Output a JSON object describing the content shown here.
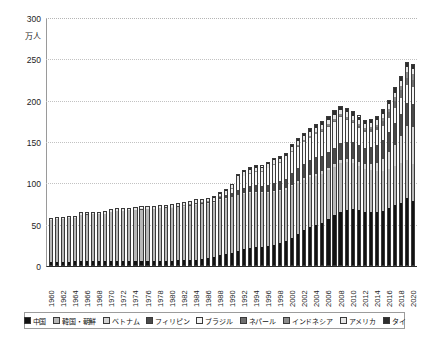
{
  "chart_data": {
    "type": "bar",
    "stacked": true,
    "title": "",
    "xlabel": "",
    "ylabel": "万人",
    "ylim": [
      0,
      300
    ],
    "yticks": [
      0,
      50,
      100,
      150,
      200,
      250,
      300
    ],
    "grid": true,
    "legend_position": "bottom",
    "categories": [
      "1960",
      "1961",
      "1962",
      "1963",
      "1964",
      "1965",
      "1966",
      "1967",
      "1968",
      "1969",
      "1970",
      "1971",
      "1972",
      "1973",
      "1974",
      "1975",
      "1976",
      "1977",
      "1978",
      "1979",
      "1980",
      "1981",
      "1982",
      "1983",
      "1984",
      "1985",
      "1986",
      "1987",
      "1988",
      "1989",
      "1990",
      "1991",
      "1992",
      "1993",
      "1994",
      "1995",
      "1996",
      "1997",
      "1998",
      "1999",
      "2000",
      "2001",
      "2002",
      "2003",
      "2004",
      "2005",
      "2006",
      "2007",
      "2008",
      "2009",
      "2010",
      "2011",
      "2012",
      "2013",
      "2014",
      "2015",
      "2016",
      "2017",
      "2018",
      "2019",
      "2020"
    ],
    "tick_labels": [
      "1960",
      "1962",
      "1964",
      "1966",
      "1968",
      "1970",
      "1972",
      "1974",
      "1976",
      "1978",
      "1980",
      "1982",
      "1984",
      "1986",
      "1988",
      "1990",
      "1992",
      "1994",
      "1996",
      "1998",
      "2000",
      "2002",
      "2004",
      "2006",
      "2008",
      "2010",
      "2012",
      "2014",
      "2016",
      "2018",
      "2020"
    ],
    "series": [
      {
        "name": "中国",
        "color": "#121212",
        "values": [
          4.2,
          4.3,
          4.3,
          4.4,
          4.5,
          4.9,
          4.9,
          5.0,
          5.0,
          5.1,
          5.1,
          5.2,
          4.9,
          4.7,
          4.7,
          4.8,
          4.8,
          4.8,
          4.9,
          5.1,
          5.3,
          5.8,
          6.0,
          6.3,
          6.7,
          7.5,
          8.5,
          9.6,
          12.9,
          13.7,
          15.0,
          17.1,
          19.5,
          21.0,
          21.9,
          22.3,
          23.4,
          25.2,
          27.2,
          29.4,
          33.6,
          38.1,
          42.4,
          46.3,
          48.7,
          52.0,
          56.0,
          60.7,
          65.5,
          68.0,
          68.7,
          67.4,
          65.3,
          64.9,
          65.5,
          66.6,
          69.6,
          73.1,
          76.4,
          81.3,
          77.8
        ]
      },
      {
        "name": "韓国・朝鮮",
        "color": "#b8b8b8",
        "values": [
          53.1,
          53.5,
          54.0,
          54.5,
          55.0,
          58.3,
          58.5,
          58.8,
          59.0,
          59.3,
          61.4,
          62.2,
          62.9,
          63.6,
          64.3,
          64.7,
          65.0,
          65.4,
          65.9,
          66.3,
          66.5,
          66.8,
          66.9,
          67.4,
          68.7,
          68.3,
          67.8,
          67.4,
          67.7,
          68.1,
          68.8,
          69.3,
          68.8,
          68.2,
          67.6,
          66.6,
          65.7,
          64.5,
          63.9,
          63.6,
          63.5,
          63.2,
          62.5,
          61.4,
          60.7,
          59.9,
          59.9,
          59.3,
          58.9,
          57.9,
          56.6,
          54.5,
          53.0,
          51.9,
          50.1,
          49.2,
          48.5,
          48.1,
          47.9,
          47.4,
          45.5
        ]
      },
      {
        "name": "ベトナム",
        "color": "#d4d4d4",
        "values": [
          0,
          0,
          0,
          0,
          0,
          0,
          0,
          0,
          0,
          0,
          0,
          0,
          0,
          0,
          0,
          0,
          0,
          0,
          0,
          0,
          0.2,
          0.3,
          0.4,
          0.5,
          0.6,
          0.7,
          0.8,
          0.9,
          1.0,
          1.1,
          0.6,
          0.7,
          0.8,
          0.9,
          1.0,
          1.1,
          1.3,
          1.5,
          1.7,
          1.9,
          1.7,
          1.9,
          2.2,
          2.4,
          2.7,
          2.9,
          3.3,
          3.7,
          4.1,
          4.1,
          4.2,
          4.5,
          5.3,
          7.2,
          10.0,
          14.7,
          19.9,
          26.2,
          33.1,
          41.2,
          44.9
        ]
      },
      {
        "name": "フィリピン",
        "color": "#4a4a4a",
        "values": [
          0.1,
          0.1,
          0.1,
          0.1,
          0.1,
          0.1,
          0.1,
          0.1,
          0.1,
          0.1,
          0.2,
          0.2,
          0.2,
          0.2,
          0.3,
          0.3,
          0.4,
          0.4,
          0.5,
          0.6,
          0.5,
          0.7,
          0.9,
          1.2,
          1.6,
          1.2,
          1.8,
          2.4,
          3.2,
          3.9,
          4.9,
          6.1,
          6.2,
          7.3,
          8.5,
          7.4,
          8.5,
          9.4,
          10.5,
          11.5,
          14.4,
          15.6,
          16.9,
          18.5,
          19.9,
          18.7,
          19.3,
          20.3,
          21.1,
          21.2,
          21.0,
          20.9,
          20.3,
          21.0,
          21.8,
          22.9,
          24.4,
          26.1,
          27.2,
          28.3,
          28.0
        ]
      },
      {
        "name": "ブラジル",
        "color": "#f4f4f4",
        "values": [
          0,
          0,
          0,
          0,
          0,
          0,
          0,
          0,
          0,
          0,
          0,
          0,
          0,
          0,
          0,
          0,
          0,
          0,
          0,
          0,
          0.1,
          0.1,
          0.1,
          0.1,
          0.2,
          0.2,
          0.2,
          0.2,
          0.4,
          1.5,
          5.6,
          11.9,
          14.7,
          15.5,
          16.0,
          17.6,
          20.2,
          23.3,
          22.2,
          22.4,
          25.4,
          26.6,
          26.8,
          27.5,
          28.7,
          30.2,
          31.3,
          31.7,
          31.2,
          26.7,
          23.0,
          21.0,
          19.0,
          18.1,
          17.6,
          17.4,
          18.0,
          19.1,
          20.2,
          21.2,
          20.9
        ]
      },
      {
        "name": "ネパール",
        "color": "#6e6e6e",
        "values": [
          0,
          0,
          0,
          0,
          0,
          0,
          0,
          0,
          0,
          0,
          0,
          0,
          0,
          0,
          0,
          0,
          0,
          0,
          0,
          0,
          0,
          0,
          0,
          0,
          0,
          0,
          0,
          0,
          0,
          0,
          0,
          0,
          0,
          0,
          0,
          0,
          0,
          0,
          0,
          0,
          0.3,
          0.3,
          0.4,
          0.4,
          0.5,
          0.6,
          0.7,
          0.9,
          1.2,
          1.5,
          1.8,
          2.1,
          2.5,
          3.2,
          4.2,
          5.5,
          6.7,
          8.0,
          8.9,
          9.7,
          9.6
        ]
      },
      {
        "name": "インドネシア",
        "color": "#8c8c8c",
        "values": [
          0,
          0,
          0,
          0,
          0,
          0,
          0,
          0,
          0,
          0,
          0,
          0,
          0,
          0,
          0,
          0,
          0,
          0,
          0,
          0,
          0.1,
          0.1,
          0.1,
          0.1,
          0.2,
          0.2,
          0.2,
          0.3,
          0.3,
          0.4,
          0.3,
          0.4,
          0.5,
          0.6,
          0.7,
          0.7,
          0.9,
          1.0,
          1.1,
          1.2,
          1.9,
          2.0,
          2.1,
          2.2,
          2.3,
          2.5,
          2.5,
          2.5,
          2.7,
          2.5,
          2.5,
          2.5,
          2.5,
          2.7,
          3.1,
          3.6,
          4.2,
          5.0,
          5.6,
          6.6,
          6.7
        ]
      },
      {
        "name": "アメリカ",
        "color": "#e6e6e6",
        "values": [
          1.1,
          1.1,
          1.1,
          1.2,
          1.2,
          1.5,
          1.5,
          1.6,
          1.6,
          1.7,
          1.9,
          2.0,
          2.0,
          2.1,
          2.1,
          2.1,
          2.1,
          2.1,
          2.1,
          2.2,
          2.2,
          2.3,
          2.5,
          2.7,
          2.8,
          2.9,
          3.1,
          3.2,
          3.4,
          3.5,
          3.8,
          4.2,
          4.2,
          4.3,
          4.4,
          4.3,
          4.4,
          4.3,
          4.2,
          4.2,
          4.5,
          4.6,
          4.7,
          4.7,
          4.8,
          4.9,
          5.1,
          5.2,
          5.2,
          5.2,
          5.1,
          5.0,
          4.9,
          4.9,
          5.1,
          5.2,
          5.4,
          5.5,
          5.7,
          5.9,
          5.6
        ]
      },
      {
        "name": "タイ",
        "color": "#2e2e2e",
        "values": [
          0.1,
          0.1,
          0.1,
          0.1,
          0.1,
          0.1,
          0.1,
          0.1,
          0.1,
          0.1,
          0.1,
          0.1,
          0.1,
          0.1,
          0.1,
          0.1,
          0.1,
          0.1,
          0.1,
          0.1,
          0.1,
          0.1,
          0.2,
          0.2,
          0.2,
          0.2,
          0.3,
          0.4,
          0.5,
          0.6,
          0.7,
          1.3,
          1.5,
          1.7,
          1.8,
          1.6,
          1.8,
          2.0,
          2.1,
          2.2,
          2.9,
          3.0,
          3.1,
          3.2,
          3.3,
          3.7,
          3.9,
          4.1,
          4.2,
          4.2,
          4.1,
          4.2,
          4.0,
          4.1,
          4.3,
          4.5,
          4.7,
          5.0,
          5.2,
          5.4,
          5.3
        ]
      }
    ]
  },
  "legend": {
    "items": [
      {
        "label": "中国",
        "color": "#121212"
      },
      {
        "label": "韓国・朝鮮",
        "color": "#b8b8b8"
      },
      {
        "label": "ベトナム",
        "color": "#d4d4d4"
      },
      {
        "label": "フィリピン",
        "color": "#4a4a4a"
      },
      {
        "label": "ブラジル",
        "color": "#f4f4f4"
      },
      {
        "label": "ネパール",
        "color": "#6e6e6e"
      },
      {
        "label": "インドネシア",
        "color": "#8c8c8c"
      },
      {
        "label": "アメリカ",
        "color": "#e6e6e6"
      },
      {
        "label": "タイ",
        "color": "#2e2e2e"
      }
    ]
  }
}
